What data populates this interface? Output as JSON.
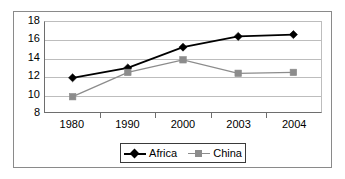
{
  "chart_data": {
    "type": "line",
    "title": "",
    "subtitle": "",
    "xlabel": "",
    "ylabel": "",
    "categories": [
      "1980",
      "1990",
      "2000",
      "2003",
      "2004"
    ],
    "yticks": [
      8,
      10,
      12,
      14,
      16,
      18
    ],
    "ylim": [
      8,
      18
    ],
    "grid": true,
    "legend_position": "bottom-center",
    "series": [
      {
        "name": "Africa",
        "values": [
          11.8,
          12.9,
          15.2,
          16.4,
          16.6
        ],
        "color": "#000000",
        "marker": "diamond"
      },
      {
        "name": "China",
        "values": [
          9.7,
          12.4,
          13.8,
          12.3,
          12.4
        ],
        "color": "#8c8c8c",
        "marker": "square"
      }
    ]
  },
  "legend": {
    "items": [
      {
        "label": "Africa",
        "marker_icon": "diamond-marker-icon"
      },
      {
        "label": "China",
        "marker_icon": "square-marker-icon"
      }
    ]
  },
  "axes": {
    "y_tick_labels": [
      "18",
      "16",
      "14",
      "12",
      "10",
      "8"
    ],
    "x_tick_labels": [
      "1980",
      "1990",
      "2000",
      "2003",
      "2004"
    ]
  }
}
